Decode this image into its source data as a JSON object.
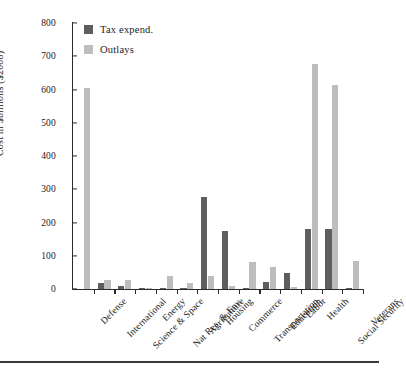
{
  "chart_data": {
    "type": "bar",
    "title": "",
    "xlabel": "",
    "ylabel": "Cost in $billions ($2008)",
    "ylim": [
      0,
      800
    ],
    "ytick_values": [
      0,
      100,
      200,
      300,
      400,
      500,
      600,
      700,
      800
    ],
    "ytick_labels": [
      "0",
      "100",
      "200",
      "300",
      "400",
      "500",
      "600",
      "700",
      "800"
    ],
    "grid": false,
    "legend_position": "top-left",
    "categories": [
      "Defense",
      "International",
      "Science & Space",
      "Energy",
      "Nat Res. & Env.",
      "Agriculture",
      "Housing",
      "Commerce",
      "Transportation",
      "Education",
      "Labor",
      "Health",
      "Social Security",
      "Veterans"
    ],
    "series": [
      {
        "name": "Tax expend.",
        "color": "#5e5e5e",
        "values": [
          0,
          18,
          10,
          2,
          3,
          2,
          278,
          175,
          3,
          20,
          48,
          180,
          180,
          2
        ]
      },
      {
        "name": "Outlays",
        "color": "#bdbdbd",
        "values": [
          605,
          28,
          27,
          3,
          38,
          18,
          40,
          10,
          80,
          65,
          5,
          678,
          613,
          85
        ]
      }
    ]
  },
  "legend": {
    "items": [
      {
        "label": "Tax expend.",
        "color": "#5e5e5e"
      },
      {
        "label": "Outlays",
        "color": "#bdbdbd"
      }
    ]
  }
}
